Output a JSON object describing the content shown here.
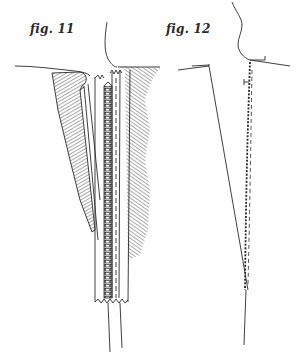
{
  "figures": [
    {
      "label": "fig. 11",
      "depicts": "zipper basted into garment opening, shown with hatched fabric and exposed zipper teeth"
    },
    {
      "label": "fig. 12",
      "depicts": "zipper stitched in place along tapered seam, outline drawing"
    }
  ],
  "colors": {
    "ink": "#2a2a2a",
    "paper": "#ffffff"
  }
}
